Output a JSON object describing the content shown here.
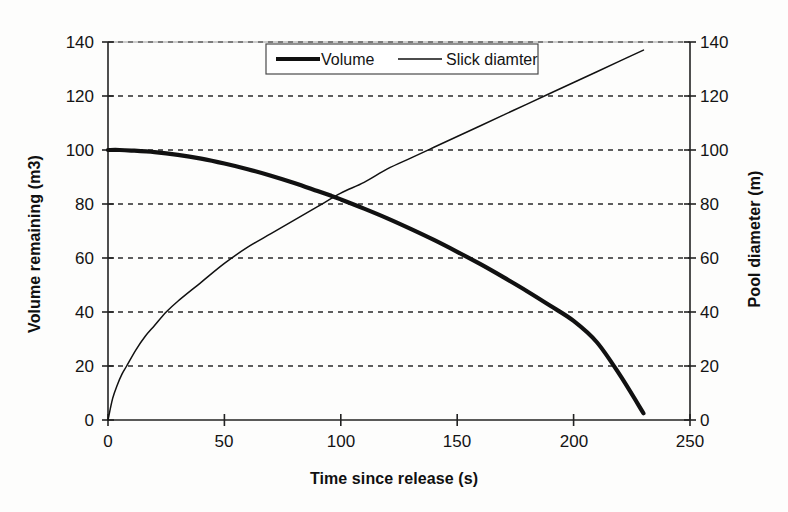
{
  "chart_data": {
    "type": "line",
    "title": "",
    "xlabel": "Time since release (s)",
    "ylabel": "Volume remaining (m3)",
    "y2label": "Pool diameter (m)",
    "xlim": [
      0,
      250
    ],
    "ylim": [
      0,
      140
    ],
    "y2lim": [
      0,
      140
    ],
    "xticks": [
      0,
      50,
      100,
      150,
      200,
      250
    ],
    "yticks": [
      0,
      20,
      40,
      60,
      80,
      100,
      120,
      140
    ],
    "y2ticks": [
      0,
      20,
      40,
      60,
      80,
      100,
      120,
      140
    ],
    "grid": "horizontal-dashed",
    "legend_position": "top-center",
    "series": [
      {
        "name": "Volume",
        "axis": "left",
        "style": "thick-solid",
        "color": "#111111",
        "x": [
          0,
          5,
          10,
          20,
          30,
          40,
          50,
          60,
          70,
          80,
          90,
          96,
          100,
          110,
          120,
          130,
          140,
          150,
          160,
          170,
          180,
          190,
          200,
          210,
          220,
          230
        ],
        "y": [
          100,
          100,
          99.8,
          99.2,
          98.2,
          96.8,
          95.0,
          92.9,
          90.5,
          87.8,
          84.8,
          83.0,
          81.7,
          78.3,
          74.7,
          70.8,
          66.7,
          62.3,
          57.7,
          52.8,
          47.7,
          42.3,
          36.7,
          28.8,
          16.5,
          2.5
        ]
      },
      {
        "name": "Slick diamter",
        "axis": "right",
        "style": "thin-solid",
        "color": "#111111",
        "x": [
          0,
          2,
          4,
          6,
          8,
          12,
          16,
          20,
          25,
          30,
          40,
          50,
          60,
          70,
          80,
          90,
          100,
          110,
          120,
          130,
          140,
          150,
          160,
          170,
          180,
          190,
          200,
          210,
          220,
          230
        ],
        "y": [
          0,
          8,
          13,
          17,
          20,
          26,
          31,
          35,
          40,
          44,
          51,
          58,
          64,
          69,
          74,
          79,
          84,
          88,
          93,
          97,
          101,
          105,
          109,
          113,
          117,
          121,
          125,
          129,
          133,
          137
        ]
      }
    ],
    "legend": [
      {
        "label": "Volume",
        "style": "thick-solid"
      },
      {
        "label": "Slick diamter",
        "style": "thin-solid"
      }
    ],
    "colors": {
      "axis": "#222222",
      "grid": "#2a2a2a",
      "series1": "#111111",
      "series2": "#111111",
      "background": "#fdfdfc"
    }
  },
  "labels": {
    "y_left": [
      "0",
      "20",
      "40",
      "60",
      "80",
      "100",
      "120",
      "140"
    ],
    "y_right": [
      "0",
      "20",
      "40",
      "60",
      "80",
      "100",
      "120",
      "140"
    ],
    "x": [
      "0",
      "50",
      "100",
      "150",
      "200",
      "250"
    ]
  },
  "titles": {
    "x_axis": "Time since release (s)",
    "y_axis_left": "Volume remaining (m3)",
    "y_axis_right": "Pool diameter (m)"
  },
  "legend": {
    "item1": "Volume",
    "item2": "Slick diamter"
  }
}
